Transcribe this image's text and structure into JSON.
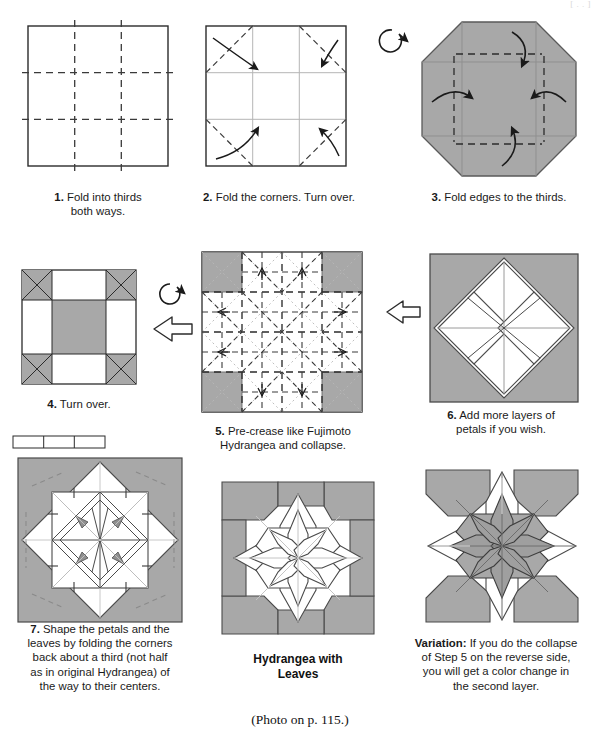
{
  "page": {
    "width": 599,
    "height": 744,
    "photo_note": "(Photo on p. 115.)",
    "top_faint_text": "[ . . ]"
  },
  "colors": {
    "paper_gray": "#a8a8a8",
    "paper_gray_dark": "#9a9a9a",
    "paper_white": "#ffffff",
    "line": "#2b2b2b",
    "line_soft": "#8f8f8f",
    "crease_dash": "#3a3a3a",
    "crease_dot": "#b0b0b0",
    "text": "#1a1a1a"
  },
  "steps": [
    {
      "id": "step1",
      "number": "1.",
      "caption": "1. Fold into thirds both ways.",
      "caption_lines": [
        "1. Fold into thirds",
        "both ways."
      ],
      "diagram": "square-thirds-grid"
    },
    {
      "id": "step2",
      "number": "2.",
      "caption": "2. Fold the corners. Turn over.",
      "caption_lines": [
        "2. Fold the corners. Turn over."
      ],
      "diagram": "square-corner-folds-arrows"
    },
    {
      "id": "step3",
      "number": "3.",
      "caption": "3. Fold edges to the thirds.",
      "caption_lines": [
        "3. Fold edges to the thirds."
      ],
      "diagram": "gray-octagon-edge-arrows"
    },
    {
      "id": "step4",
      "number": "4.",
      "caption": "4. Turn over.",
      "caption_lines": [
        "4. Turn over."
      ],
      "diagram": "three-by-three-gray-corners"
    },
    {
      "id": "step5",
      "number": "5.",
      "caption": "5. Pre-crease like Fujimoto Hydrangea and collapse.",
      "caption_lines": [
        "5. Pre-crease like Fujimoto",
        "Hydrangea and collapse."
      ],
      "diagram": "fujimoto-precrease-pattern"
    },
    {
      "id": "step6",
      "number": "6.",
      "caption": "6. Add more layers of petals if you wish.",
      "caption_lines": [
        "6. Add more layers of",
        "petals if you wish."
      ],
      "diagram": "gray-square-white-diamond"
    },
    {
      "id": "step7",
      "number": "7.",
      "caption": "7. Shape the petals and the leaves by folding the corners back about a third (not half as in original Hydrangea) of the way to their centers.",
      "caption_lines": [
        "7. Shape the petals and the",
        "leaves by folding the corners",
        "back about a third (not half",
        "as in original Hydrangea) of",
        "the way to their centers."
      ],
      "diagram": "shaped-model-with-bracket"
    }
  ],
  "result": {
    "id": "result",
    "label_lines": [
      "Hydrangea with",
      "Leaves"
    ],
    "label": "Hydrangea with Leaves",
    "diagram": "finished-eight-petal-flower"
  },
  "variation": {
    "id": "variation",
    "lead": "Variation:",
    "caption": "Variation: If you do the collapse of Step 5 on the reverse side, you will get a color change in the second layer.",
    "caption_lines": [
      "If you do the collapse",
      "of Step 5 on the reverse side,",
      "you will get a color change in",
      "the second layer."
    ],
    "diagram": "color-change-flower"
  },
  "symbols": {
    "turn_over_1": "turn-over-arrow",
    "turn_over_2": "turn-over-arrow",
    "proceed_1": "hollow-block-arrow-right",
    "proceed_2": "hollow-block-arrow-right",
    "bracket": "thirds-measure-bracket"
  }
}
